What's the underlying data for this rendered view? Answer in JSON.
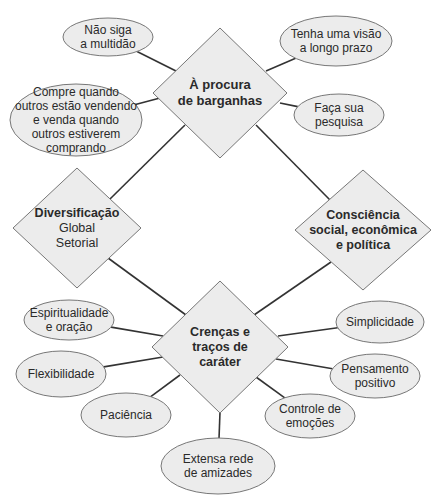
{
  "colors": {
    "background": "#ffffff",
    "shape_fill": "#ececec",
    "shape_stroke": "#777777",
    "connector": "#333333",
    "text": "#2a2a2a"
  },
  "diamonds": [
    {
      "id": "bargains",
      "lines": [
        "À procura",
        "de barganhas"
      ],
      "subtitle_lines": [],
      "cx": 220,
      "cy": 93,
      "hw": 67,
      "hh": 65
    },
    {
      "id": "diversification",
      "lines": [
        "Diversificação"
      ],
      "subtitle_lines": [
        "Global",
        "Setorial"
      ],
      "cx": 77,
      "cy": 228,
      "hw": 64,
      "hh": 60
    },
    {
      "id": "awareness",
      "lines": [
        "Consciência",
        "social, econômica",
        "e política"
      ],
      "subtitle_lines": [],
      "cx": 363,
      "cy": 230,
      "hw": 68,
      "hh": 60
    },
    {
      "id": "beliefs",
      "lines": [
        "Crenças e",
        "traços de",
        "caráter"
      ],
      "subtitle_lines": [],
      "cx": 220,
      "cy": 347,
      "hw": 68,
      "hh": 66
    }
  ],
  "ellipses": [
    {
      "id": "dont-follow-crowd",
      "lines": [
        "Não siga",
        "a multidão"
      ],
      "cx": 108,
      "cy": 37,
      "rx": 45,
      "ry": 19,
      "attach": [
        176,
        71
      ]
    },
    {
      "id": "long-term-vision",
      "lines": [
        "Tenha uma visão",
        "a longo prazo"
      ],
      "cx": 336,
      "cy": 41,
      "rx": 56,
      "ry": 25,
      "attach": [
        266,
        71
      ]
    },
    {
      "id": "buy-sell",
      "lines": [
        "Compre quando",
        "outros estão vendendo",
        "e venda quando",
        "outros estiverem",
        "comprando"
      ],
      "cx": 76,
      "cy": 120,
      "rx": 66,
      "ry": 36,
      "attach": [
        160,
        98
      ]
    },
    {
      "id": "research",
      "lines": [
        "Faça sua",
        "pesquisa"
      ],
      "cx": 339,
      "cy": 115,
      "rx": 45,
      "ry": 21,
      "attach": [
        280,
        103
      ]
    },
    {
      "id": "spirituality",
      "lines": [
        "Espiritualidade",
        "e oração"
      ],
      "cx": 69,
      "cy": 320,
      "rx": 45,
      "ry": 20,
      "attach": [
        163,
        336
      ]
    },
    {
      "id": "simplicity",
      "lines": [
        "Simplicidade"
      ],
      "cx": 380,
      "cy": 322,
      "rx": 44,
      "ry": 21,
      "attach": [
        278,
        336
      ]
    },
    {
      "id": "flexibility",
      "lines": [
        "Flexibilidade"
      ],
      "cx": 61,
      "cy": 374,
      "rx": 45,
      "ry": 23,
      "attach": [
        163,
        357
      ]
    },
    {
      "id": "positive-thinking",
      "lines": [
        "Pensamento",
        "positivo"
      ],
      "cx": 375,
      "cy": 376,
      "rx": 45,
      "ry": 22,
      "attach": [
        276,
        359
      ]
    },
    {
      "id": "patience",
      "lines": [
        "Paciência"
      ],
      "cx": 126,
      "cy": 415,
      "rx": 45,
      "ry": 22,
      "attach": [
        180,
        375
      ]
    },
    {
      "id": "emotional-control",
      "lines": [
        "Controle de",
        "emoções"
      ],
      "cx": 310,
      "cy": 416,
      "rx": 45,
      "ry": 22,
      "attach": [
        256,
        377
      ]
    },
    {
      "id": "network-friends",
      "lines": [
        "Extensa rede",
        "de amizades"
      ],
      "cx": 218,
      "cy": 466,
      "rx": 57,
      "ry": 28,
      "attach": [
        220,
        412
      ]
    }
  ],
  "connectors": [
    {
      "from": "bargains",
      "to": "diversification",
      "x1": 185,
      "y1": 125,
      "x2": 110,
      "y2": 199
    },
    {
      "from": "bargains",
      "to": "awareness",
      "x1": 256,
      "y1": 125,
      "x2": 330,
      "y2": 200
    },
    {
      "from": "diversification",
      "to": "beliefs",
      "x1": 108,
      "y1": 258,
      "x2": 186,
      "y2": 315
    },
    {
      "from": "awareness",
      "to": "beliefs",
      "x1": 331,
      "y1": 262,
      "x2": 254,
      "y2": 315
    }
  ]
}
